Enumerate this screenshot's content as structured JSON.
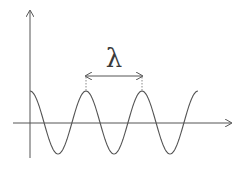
{
  "diagram": {
    "title": "",
    "wavelength_label": "λ",
    "colors": {
      "background": "#ffffff",
      "stroke": "#555555",
      "dotted": "#888888"
    },
    "axes": {
      "x_axis": {
        "y": 123,
        "x_start": 13,
        "x_end": 232,
        "arrow": true
      },
      "y_axis": {
        "x": 30,
        "y_start": 158,
        "y_end": 10,
        "arrow": true
      }
    },
    "wave": {
      "type": "cosine",
      "amplitude_px": 31.5,
      "center_y": 122.5,
      "start_x": 30,
      "period_px": 56,
      "peaks_x": [
        30,
        86,
        142
      ],
      "troughs_x": [
        58,
        114,
        170
      ],
      "end_x": 198
    },
    "wavelength_marker": {
      "x_start": 86,
      "x_end": 142,
      "y": 76,
      "double_arrow": true,
      "dotted_guides_to_peaks": true
    }
  }
}
